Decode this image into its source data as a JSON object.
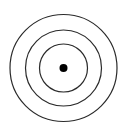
{
  "diagram": {
    "type": "concentric-circles",
    "center": [
      63.5,
      68
    ],
    "rings": [
      {
        "name": "outer",
        "radius": 54
      },
      {
        "name": "middle",
        "radius": 38
      },
      {
        "name": "inner",
        "radius": 24
      }
    ],
    "dot_radius": 4,
    "stroke_color": "#2a2a2a",
    "dot_color": "#000000",
    "background": "#ffffff"
  }
}
